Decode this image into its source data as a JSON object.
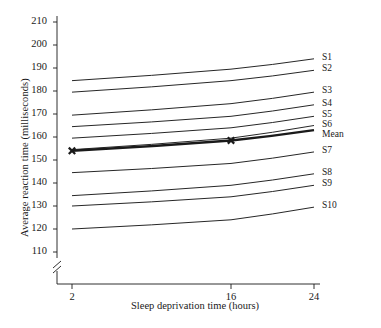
{
  "chart_data": {
    "type": "line",
    "title": "",
    "xlabel": "Sleep deprivation time (hours)",
    "ylabel": "Average reaction time (milliseconds)",
    "x": [
      2,
      16,
      24
    ],
    "xticks": [
      "2",
      "16",
      "24"
    ],
    "xlim": [
      0,
      26
    ],
    "ylim": [
      105,
      212
    ],
    "yticks": [
      "110",
      "120",
      "130",
      "140",
      "150",
      "160",
      "170",
      "180",
      "190",
      "200",
      "210"
    ],
    "grid": false,
    "legend_position": "right-inline-labels",
    "axis_break": {
      "axis": "y",
      "below": "110",
      "symbol": "//"
    },
    "series": [
      {
        "name": "S1",
        "label": "S1",
        "values": [
          184.5,
          189.5,
          194.0
        ],
        "bold": false,
        "markers": false
      },
      {
        "name": "S2",
        "label": "S2",
        "values": [
          179.5,
          184.5,
          189.0
        ],
        "bold": false,
        "markers": false
      },
      {
        "name": "S3",
        "label": "S3",
        "values": [
          169.5,
          174.5,
          179.5
        ],
        "bold": false,
        "markers": false
      },
      {
        "name": "S4",
        "label": "S4",
        "values": [
          164.5,
          169.0,
          174.0
        ],
        "bold": false,
        "markers": false
      },
      {
        "name": "S5",
        "label": "S5",
        "values": [
          159.5,
          164.0,
          169.0
        ],
        "bold": false,
        "markers": false
      },
      {
        "name": "S6",
        "label": "S6",
        "values": [
          154.5,
          159.5,
          165.0
        ],
        "bold": false,
        "markers": false
      },
      {
        "name": "Mean",
        "label": "Mean",
        "values": [
          154.0,
          158.5,
          163.0
        ],
        "bold": true,
        "markers": true
      },
      {
        "name": "S7",
        "label": "S7",
        "values": [
          144.5,
          148.5,
          153.5
        ],
        "bold": false,
        "markers": false
      },
      {
        "name": "S8",
        "label": "S8",
        "values": [
          134.5,
          139.0,
          144.0
        ],
        "bold": false,
        "markers": false
      },
      {
        "name": "S9",
        "label": "S9",
        "values": [
          130.0,
          134.0,
          139.0
        ],
        "bold": false,
        "markers": false
      },
      {
        "name": "S10",
        "label": "S10",
        "values": [
          120.0,
          124.0,
          129.5
        ],
        "bold": false,
        "markers": false
      }
    ],
    "line_color": "#1a1a1a",
    "background_color": "#ffffff"
  }
}
